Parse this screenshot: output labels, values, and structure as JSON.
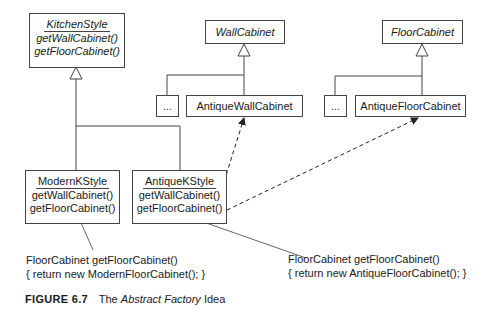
{
  "diagram": {
    "abstract_factory": {
      "name": "KitchenStyle",
      "methods": [
        "getWallCabinet()",
        "getFloorCabinet()"
      ]
    },
    "abstract_products": [
      {
        "name": "WallCabinet"
      },
      {
        "name": "FloorCabinet"
      }
    ],
    "wall_subclasses": [
      {
        "name": "..."
      },
      {
        "name": "AntiqueWallCabinet"
      }
    ],
    "floor_subclasses": [
      {
        "name": "..."
      },
      {
        "name": "AntiqueFloorCabinet"
      }
    ],
    "concrete_factories": [
      {
        "name": "ModernKStyle",
        "methods": [
          "getWallCabinet()",
          "getFloorCabinet()"
        ]
      },
      {
        "name": "AntiqueKStyle",
        "methods": [
          "getWallCabinet()",
          "getFloorCabinet()"
        ]
      }
    ],
    "notes": [
      {
        "lines": [
          "FloorCabinet getFloorCabinet()",
          "{ return new ModernFloorCabinet(); }"
        ]
      },
      {
        "lines": [
          "FloorCabinet getFloorCabinet()",
          "{ return new AntiqueFloorCabinet(); }"
        ]
      }
    ],
    "relations": [
      {
        "type": "generalization",
        "from": "ModernKStyle",
        "to": "KitchenStyle"
      },
      {
        "type": "generalization",
        "from": "AntiqueKStyle",
        "to": "KitchenStyle"
      },
      {
        "type": "generalization",
        "from": "...",
        "to": "WallCabinet"
      },
      {
        "type": "generalization",
        "from": "AntiqueWallCabinet",
        "to": "WallCabinet"
      },
      {
        "type": "generalization",
        "from": "...",
        "to": "FloorCabinet"
      },
      {
        "type": "generalization",
        "from": "AntiqueFloorCabinet",
        "to": "FloorCabinet"
      },
      {
        "type": "dependency",
        "from": "AntiqueKStyle.getWallCabinet()",
        "to": "AntiqueWallCabinet"
      },
      {
        "type": "dependency",
        "from": "AntiqueKStyle.getFloorCabinet()",
        "to": "AntiqueFloorCabinet"
      }
    ]
  },
  "caption": {
    "figure_label": "FIGURE 6.7",
    "prefix": "The",
    "italic_part": "Abstract Factory",
    "suffix": "Idea"
  }
}
